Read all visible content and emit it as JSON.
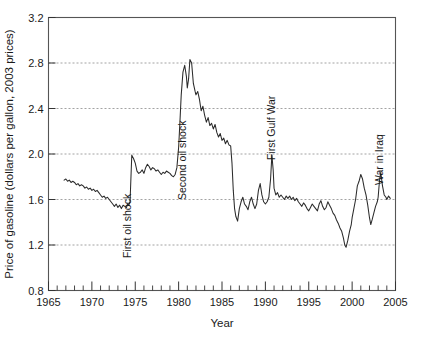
{
  "chart_data": {
    "type": "line",
    "title": "",
    "xlabel": "Year",
    "ylabel": "Price of gasoline (dollars per gallon, 2003 prices)",
    "xlim": [
      1965,
      2005
    ],
    "ylim": [
      0.8,
      3.2
    ],
    "grid": true,
    "grid_axis": "y",
    "legend": "none",
    "xticks": [
      1965,
      1970,
      1975,
      1980,
      1985,
      1990,
      1995,
      2000,
      2005
    ],
    "xtick_labels": [
      "1965",
      "1970",
      "1975",
      "1980",
      "1985",
      "1990",
      "1995",
      "2000",
      "2005"
    ],
    "xminor_step": 1,
    "yticks": [
      0.8,
      1.2,
      1.6,
      2.0,
      2.4,
      2.8,
      3.2
    ],
    "ytick_labels": [
      "0.8",
      "1.2",
      "1.6",
      "2.0",
      "2.4",
      "2.8",
      "3.2"
    ],
    "series": [
      {
        "name": "Price of gasoline (2003 dollars)",
        "color": "#2b2b2b",
        "x": [
          1966.8,
          1967.0,
          1967.2,
          1967.4,
          1967.6,
          1967.8,
          1968.0,
          1968.2,
          1968.4,
          1968.6,
          1968.8,
          1969.0,
          1969.2,
          1969.4,
          1969.6,
          1969.8,
          1970.0,
          1970.2,
          1970.4,
          1970.6,
          1970.8,
          1971.0,
          1971.2,
          1971.4,
          1971.6,
          1971.8,
          1972.0,
          1972.2,
          1972.4,
          1972.6,
          1972.8,
          1973.0,
          1973.2,
          1973.4,
          1973.6,
          1973.8,
          1974.0,
          1974.1,
          1974.25,
          1974.4,
          1974.6,
          1974.8,
          1975.0,
          1975.2,
          1975.4,
          1975.6,
          1975.8,
          1976.0,
          1976.2,
          1976.4,
          1976.6,
          1976.8,
          1977.0,
          1977.2,
          1977.4,
          1977.6,
          1977.8,
          1978.0,
          1978.2,
          1978.4,
          1978.6,
          1978.8,
          1979.0,
          1979.2,
          1979.4,
          1979.6,
          1979.8,
          1980.0,
          1980.15,
          1980.3,
          1980.5,
          1980.7,
          1980.9,
          1981.0,
          1981.15,
          1981.3,
          1981.5,
          1981.7,
          1981.9,
          1982.0,
          1982.2,
          1982.4,
          1982.6,
          1982.8,
          1983.0,
          1983.2,
          1983.4,
          1983.6,
          1983.8,
          1984.0,
          1984.2,
          1984.4,
          1984.6,
          1984.8,
          1985.0,
          1985.2,
          1985.4,
          1985.6,
          1985.8,
          1986.0,
          1986.15,
          1986.3,
          1986.45,
          1986.6,
          1986.8,
          1987.0,
          1987.2,
          1987.4,
          1987.6,
          1987.8,
          1988.0,
          1988.2,
          1988.4,
          1988.6,
          1988.8,
          1989.0,
          1989.2,
          1989.4,
          1989.6,
          1989.8,
          1990.0,
          1990.2,
          1990.4,
          1990.6,
          1990.75,
          1990.9,
          1991.0,
          1991.2,
          1991.4,
          1991.6,
          1991.8,
          1992.0,
          1992.2,
          1992.4,
          1992.6,
          1992.8,
          1993.0,
          1993.2,
          1993.4,
          1993.6,
          1993.8,
          1994.0,
          1994.2,
          1994.4,
          1994.6,
          1994.8,
          1995.0,
          1995.2,
          1995.4,
          1995.6,
          1995.8,
          1996.0,
          1996.2,
          1996.4,
          1996.6,
          1996.8,
          1997.0,
          1997.2,
          1997.4,
          1997.6,
          1997.8,
          1998.0,
          1998.2,
          1998.4,
          1998.6,
          1998.8,
          1999.0,
          1999.15,
          1999.3,
          1999.5,
          1999.7,
          1999.9,
          2000.0,
          2000.2,
          2000.4,
          2000.6,
          2000.8,
          2001.0,
          2001.2,
          2001.4,
          2001.6,
          2001.8,
          2002.0,
          2002.15,
          2002.3,
          2002.5,
          2002.7,
          2002.9,
          2003.0,
          2003.15,
          2003.3,
          2003.5,
          2003.7,
          2003.9,
          2004.0,
          2004.2,
          2004.4
        ],
        "y": [
          1.77,
          1.78,
          1.76,
          1.77,
          1.75,
          1.76,
          1.75,
          1.73,
          1.74,
          1.72,
          1.73,
          1.72,
          1.7,
          1.71,
          1.69,
          1.7,
          1.68,
          1.69,
          1.67,
          1.68,
          1.66,
          1.64,
          1.62,
          1.63,
          1.61,
          1.62,
          1.6,
          1.58,
          1.56,
          1.54,
          1.56,
          1.53,
          1.55,
          1.52,
          1.55,
          1.54,
          1.53,
          1.56,
          1.55,
          1.58,
          1.99,
          1.96,
          1.92,
          1.85,
          1.83,
          1.84,
          1.86,
          1.83,
          1.88,
          1.91,
          1.89,
          1.86,
          1.88,
          1.87,
          1.85,
          1.86,
          1.84,
          1.82,
          1.84,
          1.83,
          1.85,
          1.84,
          1.83,
          1.81,
          1.8,
          1.82,
          1.88,
          2.06,
          2.28,
          2.52,
          2.72,
          2.78,
          2.68,
          2.58,
          2.66,
          2.83,
          2.8,
          2.62,
          2.55,
          2.52,
          2.55,
          2.48,
          2.38,
          2.42,
          2.34,
          2.28,
          2.32,
          2.25,
          2.27,
          2.22,
          2.26,
          2.19,
          2.15,
          2.18,
          2.12,
          2.14,
          2.09,
          2.12,
          2.08,
          2.07,
          1.92,
          1.68,
          1.52,
          1.45,
          1.41,
          1.52,
          1.58,
          1.62,
          1.56,
          1.54,
          1.51,
          1.58,
          1.62,
          1.56,
          1.52,
          1.56,
          1.68,
          1.74,
          1.64,
          1.58,
          1.56,
          1.58,
          1.62,
          1.78,
          1.99,
          1.86,
          1.7,
          1.64,
          1.66,
          1.62,
          1.64,
          1.62,
          1.6,
          1.63,
          1.61,
          1.63,
          1.6,
          1.62,
          1.59,
          1.61,
          1.58,
          1.56,
          1.54,
          1.57,
          1.55,
          1.52,
          1.5,
          1.53,
          1.56,
          1.54,
          1.52,
          1.5,
          1.56,
          1.59,
          1.54,
          1.51,
          1.53,
          1.58,
          1.55,
          1.52,
          1.48,
          1.46,
          1.42,
          1.39,
          1.35,
          1.32,
          1.26,
          1.2,
          1.18,
          1.24,
          1.32,
          1.38,
          1.44,
          1.52,
          1.6,
          1.72,
          1.76,
          1.82,
          1.78,
          1.7,
          1.64,
          1.55,
          1.44,
          1.38,
          1.42,
          1.48,
          1.54,
          1.58,
          1.62,
          1.76,
          1.84,
          1.72,
          1.64,
          1.62,
          1.6,
          1.63,
          1.61
        ]
      }
    ],
    "annotations": [
      {
        "id": "first-oil-shock",
        "label": "First oil shock",
        "x": 1974.1,
        "rotation": -90
      },
      {
        "id": "second-oil-shock",
        "label": "Second oil shock",
        "x": 1980.4,
        "rotation": -90
      },
      {
        "id": "first-gulf-war",
        "label": "First Gulf War",
        "x": 1990.7,
        "rotation": -90
      },
      {
        "id": "war-in-iraq",
        "label": "War in Iraq",
        "x": 2003.1,
        "rotation": -90
      }
    ]
  }
}
